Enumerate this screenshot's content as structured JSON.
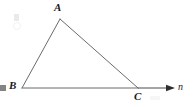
{
  "figure": {
    "type": "geometry-diagram",
    "background_color": "#ffffff",
    "stroke_color": "#6b6b6b",
    "label_color": "#1a1a1a",
    "stroke_width": 1,
    "canvas": {
      "width": 196,
      "height": 107
    },
    "points": {
      "A": {
        "x": 60,
        "y": 19,
        "label": "A"
      },
      "B": {
        "x": 22,
        "y": 88,
        "label": "B"
      },
      "C": {
        "x": 138,
        "y": 88,
        "label": "C"
      }
    },
    "segments": [
      {
        "name": "AB",
        "from": "B",
        "to": "A"
      },
      {
        "name": "AC",
        "from": "A",
        "to": "C"
      },
      {
        "name": "BC",
        "from": "B",
        "to": "C"
      }
    ],
    "ray": {
      "name": "ray-n",
      "label": "n",
      "from": {
        "x": 138,
        "y": 88
      },
      "to": {
        "x": 174,
        "y": 88
      },
      "arrowhead": true
    },
    "labels": {
      "A": "A",
      "B": "B",
      "C": "C",
      "n": "n"
    }
  }
}
